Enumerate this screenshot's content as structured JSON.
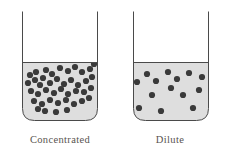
{
  "figure": {
    "canvas": {
      "width": 228,
      "height": 155,
      "background": "#ffffff"
    },
    "style": {
      "outline_color": "#4a4a4a",
      "outline_width": 1,
      "liquid_color": "#dedede",
      "solute_color": "#3a3a3a",
      "vessel_interior_color": "#ffffff",
      "caption_color": "#59544f",
      "caption_font_size": 10.5,
      "dot_radius": 3.1,
      "corner_radius": 12
    },
    "beakers": [
      {
        "id": "concentrated",
        "caption": "Concentrated",
        "caption_x": 60,
        "caption_y": 143,
        "geometry": {
          "left": 22.5,
          "right": 97.5,
          "top": 11.5,
          "bottom": 120.5,
          "liquid_level_y": 62.5,
          "corner_radius": 12
        },
        "solute_count": 42,
        "dots": [
          [
            30,
            75
          ],
          [
            36,
            72
          ],
          [
            46,
            70
          ],
          [
            52,
            74
          ],
          [
            60,
            68
          ],
          [
            68,
            71
          ],
          [
            75,
            67
          ],
          [
            82,
            72
          ],
          [
            90,
            69
          ],
          [
            94,
            64
          ],
          [
            28,
            83
          ],
          [
            35,
            80
          ],
          [
            43,
            78
          ],
          [
            40,
            85
          ],
          [
            50,
            83
          ],
          [
            57,
            79
          ],
          [
            64,
            84
          ],
          [
            71,
            80
          ],
          [
            78,
            85
          ],
          [
            86,
            81
          ],
          [
            92,
            77
          ],
          [
            31,
            91
          ],
          [
            38,
            94
          ],
          [
            46,
            90
          ],
          [
            54,
            93
          ],
          [
            61,
            89
          ],
          [
            68,
            94
          ],
          [
            76,
            91
          ],
          [
            84,
            92
          ],
          [
            91,
            88
          ],
          [
            34,
            101
          ],
          [
            42,
            104
          ],
          [
            50,
            100
          ],
          [
            58,
            103
          ],
          [
            66,
            100
          ],
          [
            74,
            104
          ],
          [
            82,
            101
          ],
          [
            89,
            98
          ],
          [
            45,
            111
          ],
          [
            56,
            112
          ],
          [
            67,
            110
          ],
          [
            38,
            109
          ]
        ]
      },
      {
        "id": "dilute",
        "caption": "Dilute",
        "caption_x": 170,
        "caption_y": 143,
        "geometry": {
          "left": 133.5,
          "right": 208.5,
          "top": 11.5,
          "bottom": 120.5,
          "liquid_level_y": 62.5,
          "corner_radius": 12
        },
        "solute_count": 13,
        "dots": [
          [
            147,
            74
          ],
          [
            168,
            72
          ],
          [
            189,
            73
          ],
          [
            202,
            77
          ],
          [
            137,
            82
          ],
          [
            156,
            81
          ],
          [
            177,
            79
          ],
          [
            199,
            90
          ],
          [
            152,
            95
          ],
          [
            171,
            88
          ],
          [
            183,
            95
          ],
          [
            139,
            108
          ],
          [
            161,
            111
          ],
          [
            193,
            108
          ]
        ]
      }
    ]
  }
}
